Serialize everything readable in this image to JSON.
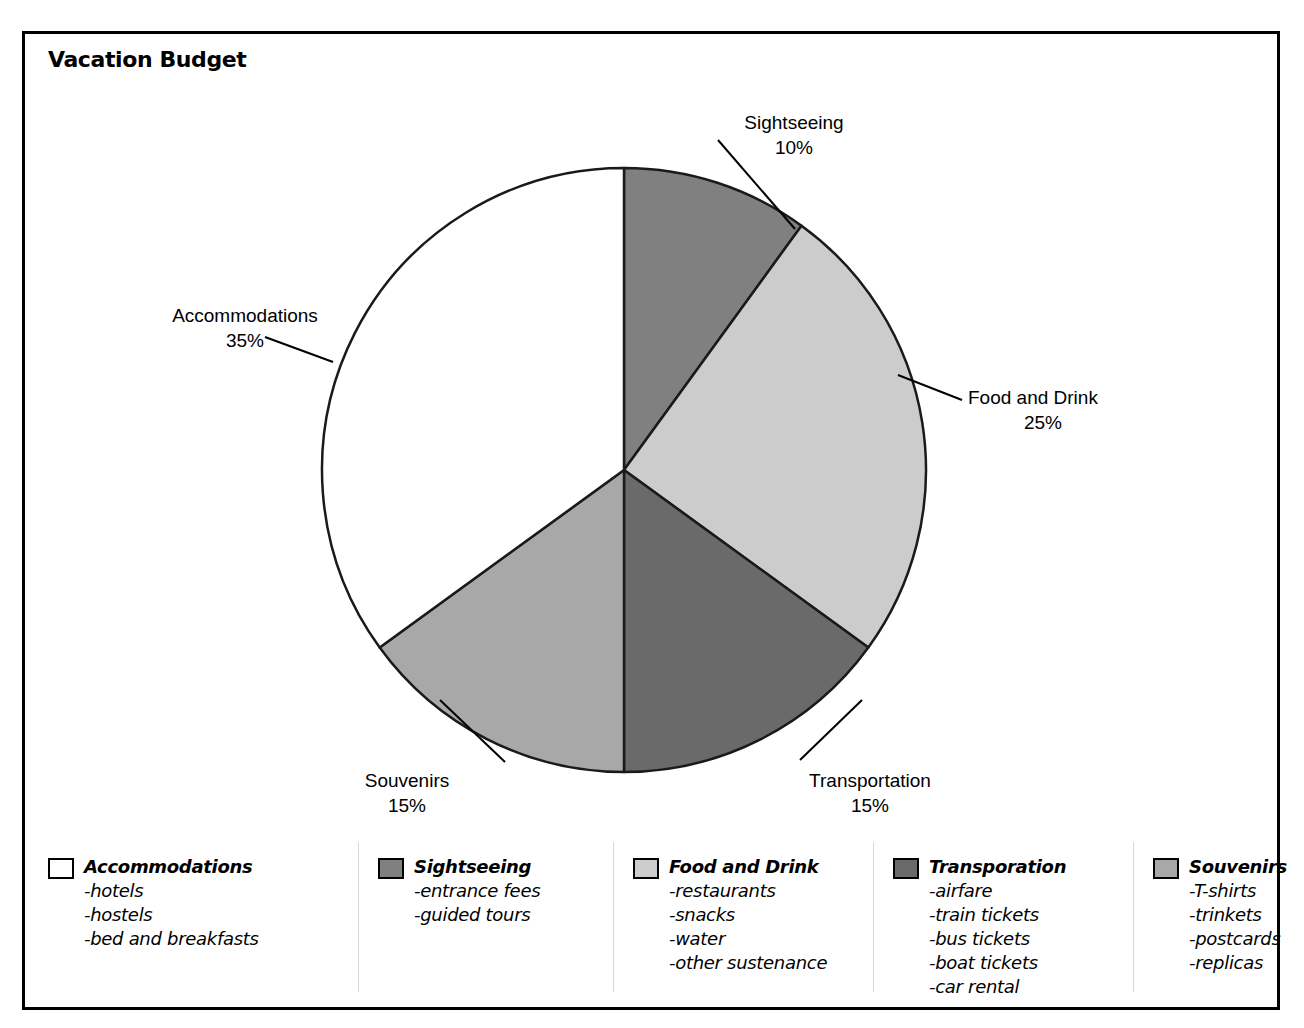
{
  "chart": {
    "title": "Vacation Budget"
  },
  "chart_data": {
    "type": "pie",
    "title": "Vacation Budget",
    "xlabel": "",
    "ylabel": "",
    "legend_position": "bottom",
    "grid": false,
    "start_angle_deg": 0,
    "direction": "clockwise",
    "categories": [
      "Sightseeing",
      "Food and Drink",
      "Transportation",
      "Souvenirs",
      "Accommodations"
    ],
    "values": [
      10,
      25,
      15,
      15,
      35
    ],
    "value_unit": "%",
    "colors": [
      "#808080",
      "#cccccc",
      "#6a6a6a",
      "#a8a8a8",
      "#ffffff"
    ],
    "slices": [
      {
        "name": "Sightseeing",
        "value": 10,
        "label": "Sightseeing",
        "percent_label": "10%",
        "color": "#808080",
        "start_deg": 0,
        "end_deg": 36
      },
      {
        "name": "Food and Drink",
        "value": 25,
        "label": "Food and Drink",
        "percent_label": "25%",
        "color": "#cccccc",
        "start_deg": 36,
        "end_deg": 126
      },
      {
        "name": "Transportation",
        "value": 15,
        "label": "Transportation",
        "percent_label": "15%",
        "color": "#6a6a6a",
        "start_deg": 126,
        "end_deg": 180
      },
      {
        "name": "Souvenirs",
        "value": 15,
        "label": "Souvenirs",
        "percent_label": "15%",
        "color": "#a8a8a8",
        "start_deg": 180,
        "end_deg": 234
      },
      {
        "name": "Accommodations",
        "value": 35,
        "label": "Accommodations",
        "percent_label": "35%",
        "color": "#ffffff",
        "start_deg": 234,
        "end_deg": 360
      }
    ]
  },
  "legend": {
    "columns": [
      {
        "title": "Accommodations",
        "swatch_color": "#ffffff",
        "items": [
          "-hotels",
          "-hostels",
          "-bed and breakfasts"
        ]
      },
      {
        "title": "Sightseeing",
        "swatch_color": "#808080",
        "items": [
          "-entrance fees",
          "-guided tours"
        ]
      },
      {
        "title": "Food and Drink",
        "swatch_color": "#cccccc",
        "items": [
          "-restaurants",
          "-snacks",
          "-water",
          "-other sustenance"
        ]
      },
      {
        "title": "Transporation",
        "swatch_color": "#6a6a6a",
        "items": [
          "-airfare",
          "-train tickets",
          "-bus tickets",
          "-boat tickets",
          "-car rental"
        ]
      },
      {
        "title": "Souvenirs",
        "swatch_color": "#a8a8a8",
        "items": [
          "-T-shirts",
          "-trinkets",
          "-postcards",
          "-replicas"
        ]
      }
    ]
  }
}
